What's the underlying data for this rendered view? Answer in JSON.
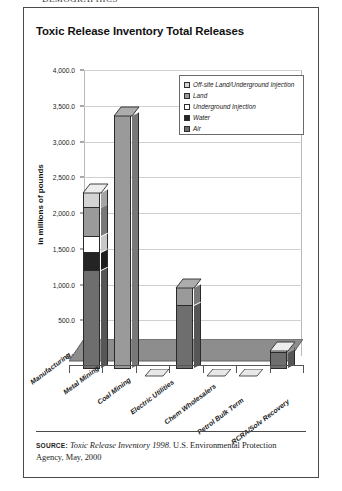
{
  "page": {
    "top_bleed_text": "DEMOGRAPHICS"
  },
  "figure": {
    "title": "Toxic Release Inventory Total Releases",
    "source_label": "SOURCE:",
    "source_italic": "Toxic Release Inventory 1998.",
    "source_rest": " U.S. Environmental Protection Agency, May, 2000"
  },
  "colors": {
    "offsite": "#d4d4d4",
    "land": "#9a9a9a",
    "underground": "#ffffff",
    "water": "#242424",
    "air": "#6e6e6e",
    "floor": "#8d8d8d",
    "outline": "#2a2a2a",
    "grid": "#cfcfcf"
  },
  "chart_data": {
    "type": "bar",
    "subtype": "stacked-3d-column",
    "title": "Toxic Release Inventory Total Releases",
    "xlabel": "",
    "ylabel": "in millions of pounds",
    "ylim": [
      0,
      4000
    ],
    "ytick_step": 500,
    "ytick_labels": [
      "4,000.0",
      "3,500.0",
      "3,000.0",
      "2,500.0",
      "2,000.0",
      "1,500.0",
      "1,000.0",
      "500.0",
      "0.0"
    ],
    "grid": true,
    "legend_position": "inside-top-right",
    "categories": [
      "Manufacturing",
      "Metal Mining",
      "Coal Mining",
      "Electric Utilities",
      "Chem Wholesalers",
      "Petrol Bulk Term",
      "RCRA/Solv Recovery"
    ],
    "series": [
      {
        "name": "Air",
        "color": "#6e6e6e",
        "values": [
          1380,
          0,
          0,
          900,
          0,
          0,
          240
        ]
      },
      {
        "name": "Water",
        "color": "#242424",
        "values": [
          250,
          0,
          0,
          0,
          0,
          0,
          0
        ]
      },
      {
        "name": "Underground Injection",
        "color": "#ffffff",
        "values": [
          230,
          0,
          0,
          0,
          0,
          0,
          0
        ]
      },
      {
        "name": "Land",
        "color": "#9a9a9a",
        "values": [
          400,
          3550,
          0,
          250,
          0,
          0,
          0
        ]
      },
      {
        "name": "Off-site Land/Underground Injection",
        "color": "#d4d4d4",
        "values": [
          220,
          0,
          0,
          0,
          0,
          0,
          20
        ]
      }
    ],
    "totals": [
      2480,
      3550,
      0,
      1150,
      0,
      0,
      260
    ]
  },
  "legend": {
    "items": [
      {
        "label": "Off-site Land/Underground Injection",
        "color": "#d4d4d4"
      },
      {
        "label": "Land",
        "color": "#9a9a9a"
      },
      {
        "label": "Underground Injection",
        "color": "#ffffff"
      },
      {
        "label": "Water",
        "color": "#242424"
      },
      {
        "label": "Air",
        "color": "#6e6e6e"
      }
    ]
  }
}
